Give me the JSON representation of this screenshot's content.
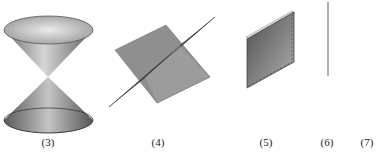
{
  "figures": [
    {
      "id": "3",
      "label": "(3)",
      "shape": "double-cone"
    },
    {
      "id": "4",
      "label": "(4)",
      "shape": "intersecting-planes"
    },
    {
      "id": "5",
      "label": "(5)",
      "shape": "plane-edge-on"
    },
    {
      "id": "6",
      "label": "(6)",
      "shape": "line"
    },
    {
      "id": "7",
      "label": "(7)",
      "shape": "point"
    }
  ],
  "colors": {
    "surface_dark": "#5a5a5a",
    "surface_mid": "#8c8c8c",
    "surface_light": "#d9d9d9",
    "line": "#7a7a7a"
  }
}
